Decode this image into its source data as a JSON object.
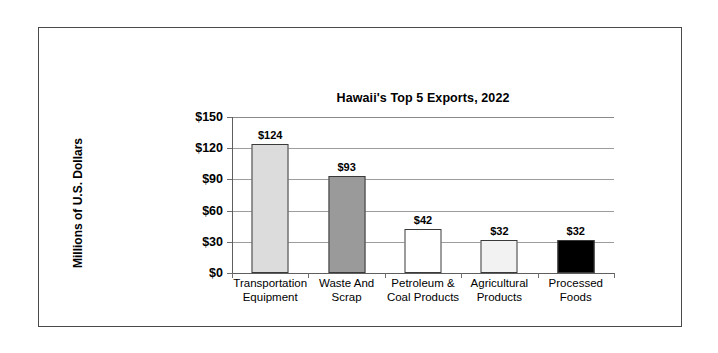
{
  "chart_data": {
    "type": "bar",
    "title": "Hawaii's Top 5 Exports, 2022",
    "xlabel": "",
    "ylabel": "Millions of U.S. Dollars",
    "ylim": [
      0,
      150
    ],
    "ytick_step": 30,
    "ytick_labels": [
      "$150",
      "$120",
      "$90",
      "$60",
      "$30",
      "$0"
    ],
    "ytick_values": [
      150,
      120,
      90,
      60,
      30,
      0
    ],
    "grid": true,
    "legend": "none",
    "categories": [
      "Transportation Equipment",
      "Waste And Scrap",
      "Petroleum & Coal Products",
      "Agricultural Products",
      "Processed Foods"
    ],
    "category_lines": [
      [
        "Transportation",
        "Equipment"
      ],
      [
        "Waste And",
        "Scrap"
      ],
      [
        "Petroleum &",
        "Coal Products"
      ],
      [
        "Agricultural",
        "Products"
      ],
      [
        "Processed",
        "Foods"
      ]
    ],
    "values": [
      124,
      93,
      42,
      32,
      32
    ],
    "data_labels": [
      "$124",
      "$93",
      "$42",
      "$32",
      "$32"
    ],
    "bar_colors": [
      "#dcdcdc",
      "#9a9a9a",
      "#ffffff",
      "#f2f2f2",
      "#000000"
    ],
    "bar_edge_color": "#3a3a3a"
  },
  "colors": {
    "frame": "#4a4a4a",
    "gridline": "#9d9d9d",
    "axis": "#5e5e5e",
    "text": "#000000",
    "background": "#ffffff"
  }
}
